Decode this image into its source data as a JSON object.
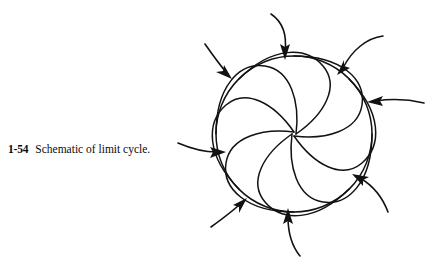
{
  "caption": {
    "figure_number": "1-54",
    "text": "Schematic of limit cycle."
  },
  "figure": {
    "name": "limit-cycle-schematic",
    "stroke_color": "#121212",
    "background_color": "#ffffff",
    "circle": {
      "label": "limit cycle",
      "cx": 294,
      "cy": 134,
      "r": 78
    },
    "spiral_count": 8,
    "arrow_count": 8,
    "spirals": [
      {
        "start_angle_deg": 0,
        "name": "spiral-arc-1"
      },
      {
        "start_angle_deg": 45,
        "name": "spiral-arc-2"
      },
      {
        "start_angle_deg": 90,
        "name": "spiral-arc-3"
      },
      {
        "start_angle_deg": 135,
        "name": "spiral-arc-4"
      },
      {
        "start_angle_deg": 180,
        "name": "spiral-arc-5"
      },
      {
        "start_angle_deg": 225,
        "name": "spiral-arc-6"
      },
      {
        "start_angle_deg": 270,
        "name": "spiral-arc-7"
      },
      {
        "start_angle_deg": 315,
        "name": "spiral-arc-8"
      }
    ],
    "arrows": [
      {
        "name": "arrow-top",
        "tip_x": 285,
        "tip_y": 57,
        "direction": "down"
      },
      {
        "name": "arrow-upper-right",
        "tip_x": 339,
        "tip_y": 73,
        "direction": "down-left"
      },
      {
        "name": "arrow-right",
        "tip_x": 370,
        "tip_y": 101,
        "direction": "left"
      },
      {
        "name": "arrow-lower-right",
        "tip_x": 355,
        "tip_y": 178,
        "direction": "up-left"
      },
      {
        "name": "arrow-bottom",
        "tip_x": 288,
        "tip_y": 212,
        "direction": "up"
      },
      {
        "name": "arrow-lower-left",
        "tip_x": 243,
        "tip_y": 203,
        "direction": "up-right"
      },
      {
        "name": "arrow-left",
        "tip_x": 223,
        "tip_y": 152,
        "direction": "right"
      },
      {
        "name": "arrow-upper-left",
        "tip_x": 228,
        "tip_y": 77,
        "direction": "down-right"
      }
    ]
  }
}
